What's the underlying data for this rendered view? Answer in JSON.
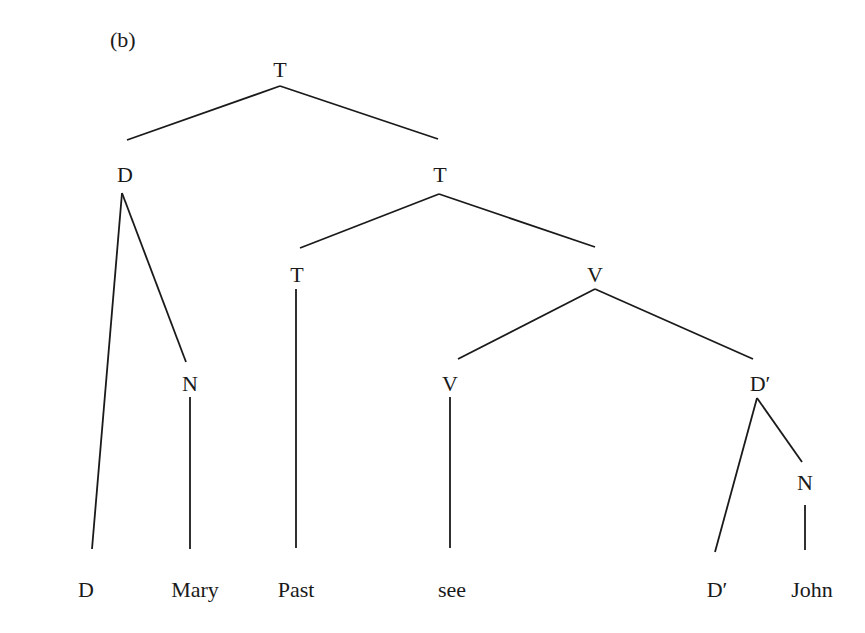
{
  "caption": "(b)",
  "tree": {
    "nodes": [
      {
        "id": "root-T",
        "label": "T",
        "x": 280,
        "y": 70
      },
      {
        "id": "D",
        "label": "D",
        "x": 125,
        "y": 175
      },
      {
        "id": "T2",
        "label": "T",
        "x": 440,
        "y": 175
      },
      {
        "id": "T3",
        "label": "T",
        "x": 297,
        "y": 275
      },
      {
        "id": "V1",
        "label": "V",
        "x": 595,
        "y": 275
      },
      {
        "id": "N1",
        "label": "N",
        "x": 190,
        "y": 384
      },
      {
        "id": "V2",
        "label": "V",
        "x": 450,
        "y": 384
      },
      {
        "id": "Dprime1",
        "label": "D′",
        "x": 760,
        "y": 384
      },
      {
        "id": "N2",
        "label": "N",
        "x": 805,
        "y": 483
      },
      {
        "id": "leaf-D",
        "label": "D",
        "x": 86,
        "y": 590
      },
      {
        "id": "leaf-Mary",
        "label": "Mary",
        "x": 195,
        "y": 590
      },
      {
        "id": "leaf-Past",
        "label": "Past",
        "x": 296,
        "y": 590
      },
      {
        "id": "leaf-see",
        "label": "see",
        "x": 452,
        "y": 590
      },
      {
        "id": "leaf-Dprime",
        "label": "D′",
        "x": 717,
        "y": 590
      },
      {
        "id": "leaf-John",
        "label": "John",
        "x": 812,
        "y": 590
      }
    ],
    "edges": [
      {
        "x1": 280,
        "y1": 86,
        "x2": 127,
        "y2": 140
      },
      {
        "x1": 280,
        "y1": 86,
        "x2": 438,
        "y2": 139
      },
      {
        "x1": 122,
        "y1": 193,
        "x2": 92,
        "y2": 549
      },
      {
        "x1": 122,
        "y1": 193,
        "x2": 186,
        "y2": 362
      },
      {
        "x1": 190,
        "y1": 397,
        "x2": 190,
        "y2": 549
      },
      {
        "x1": 439,
        "y1": 194,
        "x2": 300,
        "y2": 248
      },
      {
        "x1": 439,
        "y1": 194,
        "x2": 595,
        "y2": 247
      },
      {
        "x1": 296,
        "y1": 289,
        "x2": 296,
        "y2": 548
      },
      {
        "x1": 595,
        "y1": 289,
        "x2": 458,
        "y2": 359
      },
      {
        "x1": 595,
        "y1": 289,
        "x2": 753,
        "y2": 359
      },
      {
        "x1": 450,
        "y1": 397,
        "x2": 450,
        "y2": 548
      },
      {
        "x1": 757,
        "y1": 398,
        "x2": 715,
        "y2": 552
      },
      {
        "x1": 757,
        "y1": 398,
        "x2": 802,
        "y2": 462
      },
      {
        "x1": 805,
        "y1": 505,
        "x2": 805,
        "y2": 550
      }
    ]
  },
  "colors": {
    "line": "#1a1a1a",
    "background": "#ffffff"
  }
}
